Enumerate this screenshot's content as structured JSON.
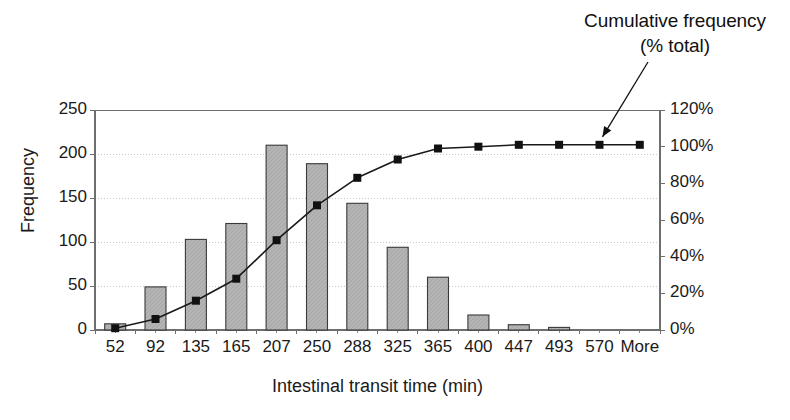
{
  "annotation": {
    "line1": "Cumulative frequency",
    "line2": "(% total)"
  },
  "axes": {
    "ylabel_left": "Frequency",
    "xlabel": "Intestinal transit time (min)",
    "yticks_left": [
      "0",
      "50",
      "100",
      "150",
      "200",
      "250"
    ],
    "yticks_right": [
      "0%",
      "20%",
      "40%",
      "60%",
      "80%",
      "100%",
      "120%"
    ]
  },
  "colors": {
    "bar_fill": "#b4b4b4",
    "bar_edge": "#3a3a3a",
    "line": "#1a1a1a",
    "marker": "#111111",
    "axis": "#6e6e6e",
    "grid": "#c8c8c8"
  },
  "caption": "",
  "chart_data": {
    "type": "bar",
    "title": "",
    "xlabel": "Intestinal transit time (min)",
    "ylabel": "Frequency",
    "ylabel_secondary": "Cumulative frequency (% total)",
    "categories": [
      "52",
      "92",
      "135",
      "165",
      "207",
      "250",
      "288",
      "325",
      "365",
      "400",
      "447",
      "493",
      "570",
      "More"
    ],
    "values": [
      7,
      49,
      103,
      121,
      210,
      189,
      144,
      94,
      60,
      17,
      6,
      3,
      0,
      0
    ],
    "ylim": [
      0,
      250
    ],
    "yticks": [
      0,
      50,
      100,
      150,
      200,
      250
    ],
    "ylim_secondary": [
      0,
      120
    ],
    "yticks_secondary": [
      0,
      20,
      40,
      60,
      80,
      100,
      120
    ],
    "grid": true,
    "legend": "none",
    "series": [
      {
        "name": "Frequency",
        "type": "bar",
        "axis": "left",
        "values": [
          7,
          49,
          103,
          121,
          210,
          189,
          144,
          94,
          60,
          17,
          6,
          3,
          0,
          0
        ]
      },
      {
        "name": "Cumulative frequency (% total)",
        "type": "line",
        "axis": "right",
        "values": [
          1,
          6,
          16,
          28,
          49,
          68,
          83,
          93,
          99,
          100,
          101,
          101,
          101,
          101
        ]
      }
    ],
    "annotations": [
      {
        "text": "Cumulative frequency (% total)",
        "target_category": "570",
        "target_value_percent": 101
      }
    ]
  }
}
